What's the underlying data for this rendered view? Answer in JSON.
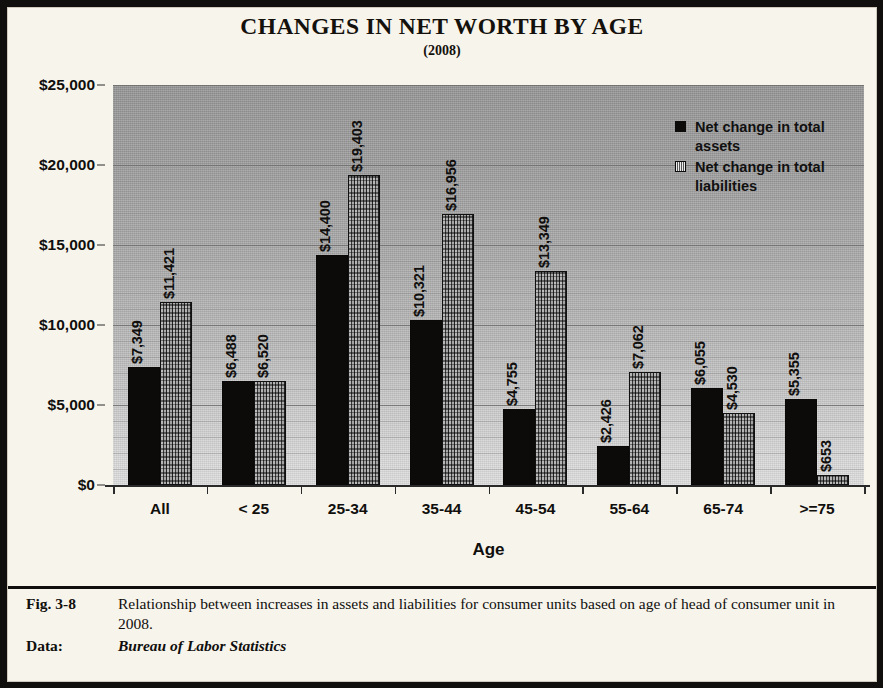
{
  "figure": {
    "caption_tag": "Fig. 3-8",
    "caption_text": "Relationship between increases in assets and liabilities for consumer units based on age of head of consumer unit in 2008.",
    "data_tag": "Data:",
    "data_source": "Bureau of Labor Statistics"
  },
  "chart_data": {
    "type": "bar",
    "title": "CHANGES IN NET WORTH BY AGE",
    "subtitle": "(2008)",
    "xlabel": "Age",
    "ylabel": "",
    "ylim": [
      0,
      25000
    ],
    "ytick_values": [
      0,
      5000,
      10000,
      15000,
      20000,
      25000
    ],
    "ytick_labels": [
      "$0",
      "$5,000",
      "$10,000",
      "$15,000",
      "$20,000",
      "$25,000"
    ],
    "minor_gridlines": true,
    "grid": true,
    "legend_position": "upper-right-inside",
    "categories": [
      "All",
      "< 25",
      "25-34",
      "35-44",
      "45-54",
      "55-64",
      "65-74",
      ">=75"
    ],
    "series": [
      {
        "name": "Net change in total assets",
        "swatch": "solid-black",
        "values": [
          7349,
          6488,
          14400,
          10321,
          4755,
          2426,
          6055,
          5355
        ],
        "labels": [
          "$7,349",
          "$6,488",
          "$14,400",
          "$10,321",
          "$4,755",
          "$2,426",
          "$6,055",
          "$5,355"
        ]
      },
      {
        "name": "Net change in total liabilities",
        "swatch": "hatched-white",
        "values": [
          11421,
          6520,
          19403,
          16956,
          13349,
          7062,
          4530,
          653
        ],
        "labels": [
          "$11,421",
          "$6,520",
          "$19,403",
          "$16,956",
          "$13,349",
          "$7,062",
          "$4,530",
          "$653"
        ]
      }
    ],
    "colors": {
      "assets_fill": "#0c0b0a",
      "liabilities_fill": "#c9c9c9",
      "plot_background_top": "#949494",
      "plot_background_bottom": "#dedede",
      "frame": "#100f0d",
      "page_background": "#f7f4ec"
    }
  }
}
